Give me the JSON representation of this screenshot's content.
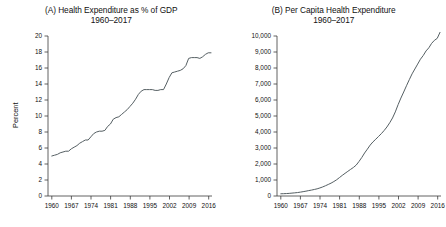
{
  "figure": {
    "background": "#ffffff",
    "line_color": "#555f63",
    "axis_color": "#3a3a3a"
  },
  "panels": [
    {
      "key": "panel_a",
      "title_line1": "(A) Health Expenditure as % of GDP",
      "title_line2": "1960–2017",
      "ylabel": "Percent",
      "xlabel": ""
    },
    {
      "key": "panel_b",
      "title_line1": "(B) Per Capita Health Expenditure",
      "title_line2": "1960–2017",
      "ylabel": "",
      "xlabel": ""
    }
  ],
  "chart_data": [
    {
      "type": "line",
      "panel": "A",
      "title": "(A) Health Expenditure as % of GDP 1960–2017",
      "xlabel": "",
      "ylabel": "Percent",
      "xlim": [
        1960,
        2017
      ],
      "ylim": [
        0,
        20
      ],
      "yticks": [
        0,
        2,
        4,
        6,
        8,
        10,
        12,
        14,
        16,
        18,
        20
      ],
      "ytick_labels": [
        "0",
        "2",
        "4",
        "6",
        "8",
        "10",
        "12",
        "14",
        "16",
        "18",
        "20"
      ],
      "xticks": [
        1960,
        1967,
        1974,
        1981,
        1988,
        1995,
        2002,
        2009,
        2016
      ],
      "xtick_labels": [
        "1960",
        "1967",
        "1974",
        "1981",
        "1988",
        "1995",
        "2002",
        "2009",
        "2016"
      ],
      "grid": false,
      "legend": null,
      "series": [
        {
          "name": "Health expenditure, % of GDP",
          "x": [
            1960,
            1961,
            1962,
            1963,
            1964,
            1965,
            1966,
            1967,
            1968,
            1969,
            1970,
            1971,
            1972,
            1973,
            1974,
            1975,
            1976,
            1977,
            1978,
            1979,
            1980,
            1981,
            1982,
            1983,
            1984,
            1985,
            1986,
            1987,
            1988,
            1989,
            1990,
            1991,
            1992,
            1993,
            1994,
            1995,
            1996,
            1997,
            1998,
            1999,
            2000,
            2001,
            2002,
            2003,
            2004,
            2005,
            2006,
            2007,
            2008,
            2009,
            2010,
            2011,
            2012,
            2013,
            2014,
            2015,
            2016,
            2017
          ],
          "values": [
            5.0,
            5.1,
            5.2,
            5.4,
            5.5,
            5.6,
            5.6,
            5.9,
            6.1,
            6.3,
            6.6,
            6.8,
            7.0,
            7.0,
            7.4,
            7.8,
            8.0,
            8.1,
            8.1,
            8.2,
            8.7,
            9.0,
            9.6,
            9.8,
            9.9,
            10.2,
            10.5,
            10.8,
            11.2,
            11.6,
            12.1,
            12.7,
            13.1,
            13.3,
            13.3,
            13.3,
            13.3,
            13.2,
            13.2,
            13.3,
            13.3,
            14.0,
            14.8,
            15.4,
            15.5,
            15.6,
            15.7,
            15.9,
            16.3,
            17.2,
            17.3,
            17.3,
            17.3,
            17.2,
            17.4,
            17.7,
            17.9,
            17.9
          ],
          "units": "percent of GDP"
        }
      ],
      "annotations": [
        {
          "text": "Plateau near 13.3% of GDP, 1993–2000"
        },
        {
          "text": "Plateau near 17.3% of GDP, 2009–2013"
        }
      ]
    },
    {
      "type": "line",
      "panel": "B",
      "title": "(B) Per Capita Health Expenditure 1960–2017",
      "xlabel": "",
      "ylabel": "",
      "xlim": [
        1960,
        2017
      ],
      "ylim": [
        0,
        10500
      ],
      "yticks": [
        0,
        1000,
        2000,
        3000,
        4000,
        5000,
        6000,
        7000,
        8000,
        9000,
        10000
      ],
      "ytick_labels": [
        "0",
        "1,000",
        "2,000",
        "3,000",
        "4,000",
        "5,000",
        "6,000",
        "7,000",
        "8,000",
        "9,000",
        "10,000"
      ],
      "xticks": [
        1960,
        1967,
        1974,
        1981,
        1988,
        1995,
        2002,
        2009,
        2016
      ],
      "xtick_labels": [
        "1960",
        "1967",
        "1974",
        "1981",
        "1988",
        "1995",
        "2002",
        "2009",
        "2016"
      ],
      "grid": false,
      "legend": null,
      "series": [
        {
          "name": "Per capita health expenditure",
          "x": [
            1960,
            1961,
            1962,
            1963,
            1964,
            1965,
            1966,
            1967,
            1968,
            1969,
            1970,
            1971,
            1972,
            1973,
            1974,
            1975,
            1976,
            1977,
            1978,
            1979,
            1980,
            1981,
            1982,
            1983,
            1984,
            1985,
            1986,
            1987,
            1988,
            1989,
            1990,
            1991,
            1992,
            1993,
            1994,
            1995,
            1996,
            1997,
            1998,
            1999,
            2000,
            2001,
            2002,
            2003,
            2004,
            2005,
            2006,
            2007,
            2008,
            2009,
            2010,
            2011,
            2012,
            2013,
            2014,
            2015,
            2016,
            2017
          ],
          "values": [
            146,
            152,
            161,
            172,
            190,
            207,
            226,
            254,
            285,
            317,
            355,
            388,
            429,
            470,
            528,
            595,
            674,
            757,
            844,
            949,
            1067,
            1209,
            1353,
            1487,
            1618,
            1748,
            1873,
            2029,
            2267,
            2528,
            2821,
            3077,
            3341,
            3551,
            3725,
            3910,
            4092,
            4298,
            4530,
            4807,
            5121,
            5518,
            5996,
            6427,
            6824,
            7233,
            7630,
            8014,
            8335,
            8656,
            8977,
            9220,
            9519,
            9725,
            10015,
            10215,
            10345,
            10739
          ],
          "units": "US dollars per capita"
        }
      ],
      "annotations": []
    }
  ]
}
